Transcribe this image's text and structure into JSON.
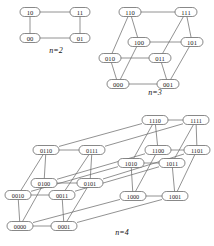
{
  "figure": {
    "name": "hypercube-graphs-figure",
    "node_fill": "#ffffff",
    "node_stroke": "#555555",
    "edge_color": "#6d6d6d",
    "text_color": "#1a1a1a",
    "background": "#ffffff"
  },
  "panels": [
    {
      "id": "q2",
      "caption": "n=2",
      "caption_pos": [
        56,
        50
      ],
      "node_w": 20,
      "node_h": 9,
      "nodes": [
        {
          "label": "10",
          "x": 30,
          "y": 12
        },
        {
          "label": "11",
          "x": 80,
          "y": 12
        },
        {
          "label": "00",
          "x": 30,
          "y": 38
        },
        {
          "label": "01",
          "x": 80,
          "y": 38
        }
      ],
      "edges": [
        [
          "10",
          "11"
        ],
        [
          "00",
          "01"
        ],
        [
          "10",
          "00"
        ],
        [
          "11",
          "01"
        ]
      ]
    },
    {
      "id": "q3",
      "caption": "n=3",
      "caption_pos": [
        155,
        92
      ],
      "node_w": 22,
      "node_h": 9,
      "nodes": [
        {
          "label": "110",
          "x": 130,
          "y": 12
        },
        {
          "label": "111",
          "x": 186,
          "y": 12
        },
        {
          "label": "100",
          "x": 139,
          "y": 42
        },
        {
          "label": "101",
          "x": 192,
          "y": 42
        },
        {
          "label": "010",
          "x": 110,
          "y": 58
        },
        {
          "label": "011",
          "x": 160,
          "y": 58
        },
        {
          "label": "000",
          "x": 118,
          "y": 84
        },
        {
          "label": "001",
          "x": 168,
          "y": 84
        }
      ],
      "edges": [
        [
          "110",
          "111"
        ],
        [
          "100",
          "101"
        ],
        [
          "010",
          "011"
        ],
        [
          "000",
          "001"
        ],
        [
          "110",
          "100"
        ],
        [
          "111",
          "101"
        ],
        [
          "010",
          "000"
        ],
        [
          "011",
          "001"
        ],
        [
          "110",
          "010"
        ],
        [
          "111",
          "011"
        ],
        [
          "100",
          "000"
        ],
        [
          "101",
          "001"
        ]
      ]
    },
    {
      "id": "q4",
      "caption": "n=4",
      "caption_pos": [
        122,
        232
      ],
      "node_w": 26,
      "node_h": 9,
      "nodes": [
        {
          "label": "1110",
          "x": 155,
          "y": 120
        },
        {
          "label": "1111",
          "x": 196,
          "y": 120
        },
        {
          "label": "1100",
          "x": 158,
          "y": 150
        },
        {
          "label": "1101",
          "x": 197,
          "y": 150
        },
        {
          "label": "1010",
          "x": 131,
          "y": 163
        },
        {
          "label": "1011",
          "x": 172,
          "y": 163
        },
        {
          "label": "1000",
          "x": 133,
          "y": 196
        },
        {
          "label": "1001",
          "x": 175,
          "y": 196
        },
        {
          "label": "0110",
          "x": 46,
          "y": 150
        },
        {
          "label": "0111",
          "x": 92,
          "y": 150
        },
        {
          "label": "0100",
          "x": 44,
          "y": 183
        },
        {
          "label": "0101",
          "x": 90,
          "y": 183
        },
        {
          "label": "0010",
          "x": 18,
          "y": 195
        },
        {
          "label": "0011",
          "x": 62,
          "y": 195
        },
        {
          "label": "0000",
          "x": 20,
          "y": 226
        },
        {
          "label": "0001",
          "x": 64,
          "y": 226
        }
      ],
      "edges": [
        [
          "1110",
          "1111"
        ],
        [
          "1100",
          "1101"
        ],
        [
          "1010",
          "1011"
        ],
        [
          "1000",
          "1001"
        ],
        [
          "0110",
          "0111"
        ],
        [
          "0100",
          "0101"
        ],
        [
          "0010",
          "0011"
        ],
        [
          "0000",
          "0001"
        ],
        [
          "1110",
          "1100"
        ],
        [
          "1111",
          "1101"
        ],
        [
          "1010",
          "1000"
        ],
        [
          "1011",
          "1001"
        ],
        [
          "0110",
          "0100"
        ],
        [
          "0111",
          "0101"
        ],
        [
          "0010",
          "0000"
        ],
        [
          "0011",
          "0001"
        ],
        [
          "1110",
          "1010"
        ],
        [
          "1111",
          "1011"
        ],
        [
          "1100",
          "1000"
        ],
        [
          "1101",
          "1001"
        ],
        [
          "0110",
          "0010"
        ],
        [
          "0111",
          "0011"
        ],
        [
          "0100",
          "0000"
        ],
        [
          "0101",
          "0001"
        ],
        [
          "1110",
          "0110"
        ],
        [
          "1111",
          "0111"
        ],
        [
          "1100",
          "0100"
        ],
        [
          "1101",
          "0101"
        ],
        [
          "1010",
          "0010"
        ],
        [
          "1011",
          "0011"
        ],
        [
          "1000",
          "0000"
        ],
        [
          "1001",
          "0001"
        ]
      ]
    }
  ]
}
